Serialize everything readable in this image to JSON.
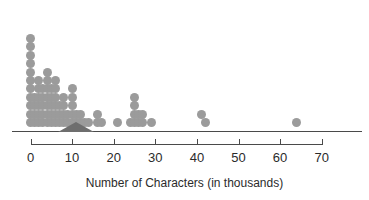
{
  "chart_data": {
    "type": "dotplot",
    "title": "",
    "xlabel": "Number of Characters (in thousands)",
    "ylabel": "",
    "xlim": [
      -2,
      74
    ],
    "xticks": [
      0,
      10,
      20,
      30,
      40,
      50,
      60,
      70
    ],
    "xtick_labels": [
      "0",
      "10",
      "20",
      "30",
      "40",
      "50",
      "60",
      "70"
    ],
    "grid": false,
    "legend": "none",
    "dot_color": "#9b9b9b",
    "axis_color": "#4a4a4a",
    "marker_color": "#6e6e6e",
    "balance_marker": {
      "shape": "triangle",
      "value": 11,
      "half_width": 4.4
    },
    "bin_width": 1,
    "dot_counts": [
      {
        "value": 0,
        "count": 11
      },
      {
        "value": 1,
        "count": 4
      },
      {
        "value": 2,
        "count": 6
      },
      {
        "value": 3,
        "count": 5
      },
      {
        "value": 4,
        "count": 7
      },
      {
        "value": 5,
        "count": 5
      },
      {
        "value": 6,
        "count": 6
      },
      {
        "value": 7,
        "count": 3
      },
      {
        "value": 8,
        "count": 4
      },
      {
        "value": 9,
        "count": 2
      },
      {
        "value": 10,
        "count": 5
      },
      {
        "value": 11,
        "count": 2
      },
      {
        "value": 12,
        "count": 2
      },
      {
        "value": 13,
        "count": 1
      },
      {
        "value": 14,
        "count": 1
      },
      {
        "value": 16,
        "count": 2
      },
      {
        "value": 17,
        "count": 1
      },
      {
        "value": 21,
        "count": 1
      },
      {
        "value": 24,
        "count": 1
      },
      {
        "value": 25,
        "count": 4
      },
      {
        "value": 26,
        "count": 2
      },
      {
        "value": 27,
        "count": 2
      },
      {
        "value": 29,
        "count": 1
      },
      {
        "value": 41,
        "count": 1
      },
      {
        "value": 42,
        "count": 1
      },
      {
        "value": 64,
        "count": 1
      }
    ],
    "total_dots": 81,
    "dots": [
      {
        "x": 0,
        "stack": 1
      },
      {
        "x": 0,
        "stack": 2
      },
      {
        "x": 0,
        "stack": 3
      },
      {
        "x": 0,
        "stack": 4
      },
      {
        "x": 0,
        "stack": 5
      },
      {
        "x": 0,
        "stack": 6
      },
      {
        "x": 0,
        "stack": 7
      },
      {
        "x": 0,
        "stack": 8
      },
      {
        "x": 0,
        "stack": 9
      },
      {
        "x": 0,
        "stack": 10
      },
      {
        "x": 0,
        "stack": 11
      },
      {
        "x": 1,
        "stack": 1
      },
      {
        "x": 1,
        "stack": 2
      },
      {
        "x": 1,
        "stack": 3
      },
      {
        "x": 1,
        "stack": 4
      },
      {
        "x": 2,
        "stack": 1
      },
      {
        "x": 2,
        "stack": 2
      },
      {
        "x": 2,
        "stack": 3
      },
      {
        "x": 2,
        "stack": 4
      },
      {
        "x": 2,
        "stack": 5
      },
      {
        "x": 2,
        "stack": 6
      },
      {
        "x": 3,
        "stack": 1
      },
      {
        "x": 3,
        "stack": 2
      },
      {
        "x": 3,
        "stack": 3
      },
      {
        "x": 3,
        "stack": 4
      },
      {
        "x": 3,
        "stack": 5
      },
      {
        "x": 4,
        "stack": 1
      },
      {
        "x": 4,
        "stack": 2
      },
      {
        "x": 4,
        "stack": 3
      },
      {
        "x": 4,
        "stack": 4
      },
      {
        "x": 4,
        "stack": 5
      },
      {
        "x": 4,
        "stack": 6
      },
      {
        "x": 4,
        "stack": 7
      },
      {
        "x": 5,
        "stack": 1
      },
      {
        "x": 5,
        "stack": 2
      },
      {
        "x": 5,
        "stack": 3
      },
      {
        "x": 5,
        "stack": 4
      },
      {
        "x": 5,
        "stack": 5
      },
      {
        "x": 6,
        "stack": 1
      },
      {
        "x": 6,
        "stack": 2
      },
      {
        "x": 6,
        "stack": 3
      },
      {
        "x": 6,
        "stack": 4
      },
      {
        "x": 6,
        "stack": 5
      },
      {
        "x": 6,
        "stack": 6
      },
      {
        "x": 7,
        "stack": 1
      },
      {
        "x": 7,
        "stack": 2
      },
      {
        "x": 7,
        "stack": 3
      },
      {
        "x": 8,
        "stack": 1
      },
      {
        "x": 8,
        "stack": 2
      },
      {
        "x": 8,
        "stack": 3
      },
      {
        "x": 8,
        "stack": 4
      },
      {
        "x": 9,
        "stack": 1
      },
      {
        "x": 9,
        "stack": 2
      },
      {
        "x": 10,
        "stack": 1
      },
      {
        "x": 10,
        "stack": 2
      },
      {
        "x": 10,
        "stack": 3
      },
      {
        "x": 10,
        "stack": 4
      },
      {
        "x": 10,
        "stack": 5
      },
      {
        "x": 11,
        "stack": 1
      },
      {
        "x": 11,
        "stack": 2
      },
      {
        "x": 12,
        "stack": 1
      },
      {
        "x": 12,
        "stack": 2
      },
      {
        "x": 13,
        "stack": 1
      },
      {
        "x": 14,
        "stack": 1
      },
      {
        "x": 16,
        "stack": 1
      },
      {
        "x": 16,
        "stack": 2
      },
      {
        "x": 17,
        "stack": 1
      },
      {
        "x": 21,
        "stack": 1
      },
      {
        "x": 24,
        "stack": 1
      },
      {
        "x": 25,
        "stack": 1
      },
      {
        "x": 25,
        "stack": 2
      },
      {
        "x": 25,
        "stack": 3
      },
      {
        "x": 25,
        "stack": 4
      },
      {
        "x": 26,
        "stack": 1
      },
      {
        "x": 26,
        "stack": 2
      },
      {
        "x": 27,
        "stack": 1
      },
      {
        "x": 27,
        "stack": 2
      },
      {
        "x": 29,
        "stack": 1
      },
      {
        "x": 41,
        "stack": 2
      },
      {
        "x": 42,
        "stack": 1
      },
      {
        "x": 64,
        "stack": 1
      }
    ]
  }
}
